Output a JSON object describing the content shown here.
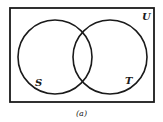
{
  "diagram": {
    "type": "venn",
    "universe_label": "U",
    "sets": [
      {
        "name": "S"
      },
      {
        "name": "T"
      }
    ],
    "caption": "(a)"
  }
}
